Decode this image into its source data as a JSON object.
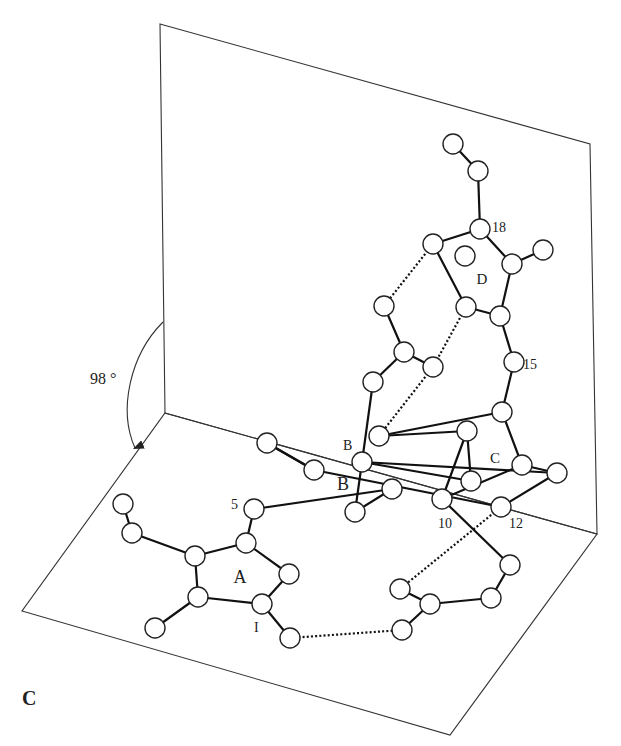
{
  "figure": {
    "panel_label": "C",
    "angle_label": "98 °",
    "ring_labels": [
      {
        "text": "A",
        "x": 240,
        "y": 583,
        "size": 18
      },
      {
        "text": "B",
        "x": 343,
        "y": 490,
        "size": 18
      },
      {
        "text": "C",
        "x": 495,
        "y": 463,
        "size": 15
      },
      {
        "text": "D",
        "x": 482,
        "y": 284,
        "size": 15
      }
    ],
    "atom_labels": [
      {
        "text": "18",
        "x": 492,
        "y": 232
      },
      {
        "text": "15",
        "x": 523,
        "y": 369
      },
      {
        "text": "10",
        "x": 438,
        "y": 528
      },
      {
        "text": "12",
        "x": 509,
        "y": 528
      },
      {
        "text": "5",
        "x": 231,
        "y": 509
      },
      {
        "text": "B",
        "x": 343,
        "y": 450
      },
      {
        "text": "I",
        "x": 254,
        "y": 632
      }
    ],
    "colors": {
      "vertical_plane": "#c4c4c4",
      "horizontal_plane": "#ffffff",
      "bond": "#111111",
      "atom_fill": "#ffffff"
    },
    "planes": {
      "vertical": [
        [
          160,
          24
        ],
        [
          590,
          144
        ],
        [
          597,
          534
        ],
        [
          165,
          413
        ]
      ],
      "horizontal": [
        [
          165,
          413
        ],
        [
          597,
          534
        ],
        [
          450,
          735
        ],
        [
          22,
          611
        ]
      ]
    },
    "atoms": [
      [
        453,
        144
      ],
      [
        478,
        171
      ],
      [
        480,
        229
      ],
      [
        433,
        244
      ],
      [
        465,
        256
      ],
      [
        512,
        264
      ],
      [
        543,
        250
      ],
      [
        466,
        307
      ],
      [
        500,
        316
      ],
      [
        384,
        306
      ],
      [
        404,
        352
      ],
      [
        433,
        367
      ],
      [
        373,
        382
      ],
      [
        514,
        362
      ],
      [
        379,
        436
      ],
      [
        502,
        412
      ],
      [
        467,
        431
      ],
      [
        522,
        465
      ],
      [
        557,
        473
      ],
      [
        362,
        462
      ],
      [
        471,
        481
      ],
      [
        442,
        499
      ],
      [
        501,
        507
      ],
      [
        392,
        489
      ],
      [
        355,
        512
      ],
      [
        314,
        470
      ],
      [
        267,
        443
      ],
      [
        254,
        509
      ],
      [
        246,
        543
      ],
      [
        195,
        556
      ],
      [
        132,
        533
      ],
      [
        123,
        504
      ],
      [
        289,
        574
      ],
      [
        198,
        597
      ],
      [
        262,
        604
      ],
      [
        155,
        628
      ],
      [
        290,
        638
      ],
      [
        400,
        589
      ],
      [
        430,
        604
      ],
      [
        402,
        630
      ],
      [
        491,
        598
      ],
      [
        510,
        565
      ]
    ],
    "bonds": [
      [
        0,
        1
      ],
      [
        1,
        2
      ],
      [
        2,
        3
      ],
      [
        2,
        5
      ],
      [
        3,
        7
      ],
      [
        5,
        6
      ],
      [
        5,
        8
      ],
      [
        7,
        8
      ],
      [
        8,
        13
      ],
      [
        13,
        15
      ],
      [
        15,
        14
      ],
      [
        15,
        17
      ],
      [
        17,
        18
      ],
      [
        17,
        21
      ],
      [
        14,
        16
      ],
      [
        16,
        20
      ],
      [
        16,
        21
      ],
      [
        20,
        19
      ],
      [
        9,
        10
      ],
      [
        10,
        11
      ],
      [
        10,
        12
      ],
      [
        12,
        19
      ],
      [
        19,
        18
      ],
      [
        18,
        22
      ],
      [
        19,
        24
      ],
      [
        24,
        23
      ],
      [
        23,
        27
      ],
      [
        25,
        26
      ],
      [
        25,
        22
      ],
      [
        26,
        25
      ],
      [
        27,
        28
      ],
      [
        28,
        29
      ],
      [
        29,
        30
      ],
      [
        30,
        31
      ],
      [
        28,
        32
      ],
      [
        29,
        33
      ],
      [
        33,
        35
      ],
      [
        33,
        34
      ],
      [
        32,
        34
      ],
      [
        34,
        36
      ],
      [
        37,
        38
      ],
      [
        38,
        39
      ],
      [
        38,
        40
      ],
      [
        40,
        41
      ],
      [
        41,
        21
      ]
    ],
    "hbonds": [
      [
        3,
        9
      ],
      [
        7,
        11
      ],
      [
        11,
        14
      ],
      [
        22,
        37
      ],
      [
        36,
        39
      ]
    ]
  }
}
